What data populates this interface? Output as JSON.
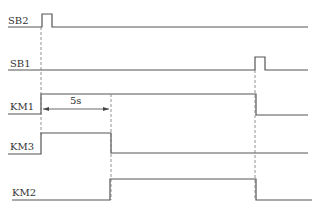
{
  "diagram": {
    "type": "timing-diagram",
    "signals": [
      {
        "name": "SB2",
        "label": "SB2"
      },
      {
        "name": "SB1",
        "label": "SB1"
      },
      {
        "name": "KM1",
        "label": "KM1"
      },
      {
        "name": "KM3",
        "label": "KM3"
      },
      {
        "name": "KM2",
        "label": "KM2"
      }
    ],
    "annotations": {
      "delay_label": "5s"
    },
    "colors": {
      "line": "#555555",
      "text": "#333333",
      "background": "#ffffff"
    }
  }
}
